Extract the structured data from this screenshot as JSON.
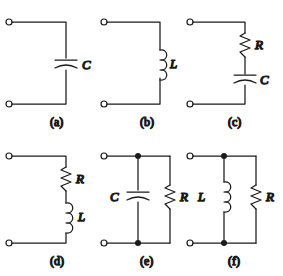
{
  "figure": {
    "type": "circuit-diagram-set",
    "background_color": "#ffffff",
    "line_color": "#1a1a1a",
    "panels": [
      {
        "id": "a",
        "caption": "(a)",
        "topology": "series",
        "components": [
          {
            "symbol": "capacitor",
            "label": "C",
            "label_side": "right"
          }
        ]
      },
      {
        "id": "b",
        "caption": "(b)",
        "topology": "series",
        "components": [
          {
            "symbol": "inductor",
            "label": "L",
            "label_side": "right"
          }
        ]
      },
      {
        "id": "c",
        "caption": "(c)",
        "topology": "series",
        "components": [
          {
            "symbol": "resistor",
            "label": "R",
            "label_side": "right"
          },
          {
            "symbol": "capacitor",
            "label": "C",
            "label_side": "right"
          }
        ]
      },
      {
        "id": "d",
        "caption": "(d)",
        "topology": "series",
        "components": [
          {
            "symbol": "resistor",
            "label": "R",
            "label_side": "right"
          },
          {
            "symbol": "inductor",
            "label": "L",
            "label_side": "right"
          }
        ]
      },
      {
        "id": "e",
        "caption": "(e)",
        "topology": "parallel",
        "junction_dots": 2,
        "components": [
          {
            "symbol": "capacitor",
            "label": "C",
            "label_side": "left"
          },
          {
            "symbol": "resistor",
            "label": "R",
            "label_side": "right"
          }
        ]
      },
      {
        "id": "f",
        "caption": "(f)",
        "topology": "parallel",
        "junction_dots": 2,
        "components": [
          {
            "symbol": "inductor",
            "label": "L",
            "label_side": "left"
          },
          {
            "symbol": "resistor",
            "label": "R",
            "label_side": "right"
          }
        ]
      }
    ],
    "labels": {
      "a_C": "C",
      "b_L": "L",
      "c_R": "R",
      "c_C": "C",
      "d_R": "R",
      "d_L": "L",
      "e_C": "C",
      "e_R": "R",
      "f_L": "L",
      "f_R": "R",
      "cap_a": "(a)",
      "cap_b": "(b)",
      "cap_c": "(c)",
      "cap_d": "(d)",
      "cap_e": "(e)",
      "cap_f": "(f)"
    }
  }
}
